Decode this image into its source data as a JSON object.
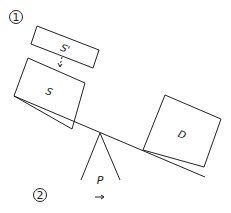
{
  "diagram": {
    "markers": [
      {
        "id": "marker-1",
        "text": "1"
      },
      {
        "id": "marker-2",
        "text": "2"
      }
    ],
    "blocks": [
      {
        "id": "block-s-prime",
        "label": "S'"
      },
      {
        "id": "block-s",
        "label": "S"
      },
      {
        "id": "block-d",
        "label": "D"
      }
    ],
    "fulcrum": {
      "label": "P",
      "arrow": "→"
    }
  }
}
